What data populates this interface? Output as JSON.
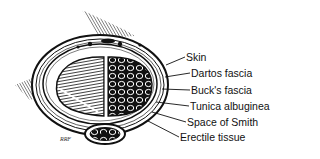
{
  "figure": {
    "type": "anatomical cross-section illustration",
    "signature": "RRF",
    "labels": [
      {
        "text": "Skin",
        "x": 186,
        "y": 51
      },
      {
        "text": "Dartos fascia",
        "x": 191,
        "y": 67
      },
      {
        "text": "Buck's fascia",
        "x": 191,
        "y": 84
      },
      {
        "text": "Tunica albuginea",
        "x": 190,
        "y": 100
      },
      {
        "text": "Space of Smith",
        "x": 187,
        "y": 116
      },
      {
        "text": "Erectile tissue",
        "x": 180,
        "y": 131
      }
    ]
  }
}
